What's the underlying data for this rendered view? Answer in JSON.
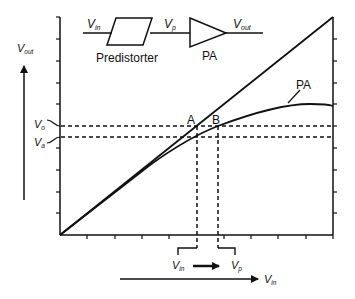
{
  "diagram": {
    "block": {
      "input_label": "V",
      "input_sub": "in",
      "predistorter_label": "Predistorter",
      "mid_label": "V",
      "mid_sub": "p",
      "amp_label": "PA",
      "output_label": "V",
      "output_sub": "out"
    },
    "axes": {
      "y_label": "V",
      "y_sub": "out",
      "x_label": "V",
      "x_sub": "in"
    },
    "levels": {
      "vo_label": "V",
      "vo_sub": "o",
      "va_label": "V",
      "va_sub": "a"
    },
    "points": {
      "a_label": "A",
      "b_label": "B"
    },
    "curve_label": "PA",
    "bottom": {
      "vin_label": "V",
      "vin_sub": "in",
      "vp_label": "V",
      "vp_sub": "p"
    },
    "colors": {
      "ink": "#111111",
      "background": "#ffffff"
    }
  }
}
